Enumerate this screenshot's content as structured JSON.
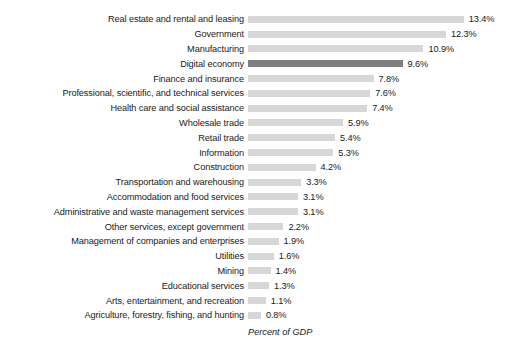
{
  "chart_data": {
    "type": "bar",
    "orientation": "horizontal",
    "title": "",
    "subtitle": "",
    "xlabel": "Percent of GDP",
    "ylabel": "",
    "xlim": [
      0,
      13.4
    ],
    "grid": false,
    "legend": null,
    "value_suffix": "%",
    "highlight_category": "Digital economy",
    "colors": {
      "bar": "#d7d7d7",
      "highlight_bar": "#7f7f7f",
      "text": "#1a1a1a",
      "background": "#ffffff"
    },
    "categories": [
      "Real estate and rental and leasing",
      "Government",
      "Manufacturing",
      "Digital economy",
      "Finance and insurance",
      "Professional, scientific, and technical services",
      "Health care and social assistance",
      "Wholesale trade",
      "Retail trade",
      "Information",
      "Construction",
      "Transportation and warehousing",
      "Accommodation and food services",
      "Administrative and waste management services",
      "Other services, except government",
      "Management of companies and enterprises",
      "Utilities",
      "Mining",
      "Educational services",
      "Arts, entertainment, and recreation",
      "Agriculture, forestry, fishing, and hunting"
    ],
    "values": [
      13.4,
      12.3,
      10.9,
      9.6,
      7.8,
      7.6,
      7.4,
      5.9,
      5.4,
      5.3,
      4.2,
      3.3,
      3.1,
      3.1,
      2.2,
      1.9,
      1.6,
      1.4,
      1.3,
      1.1,
      0.8
    ],
    "value_labels": [
      "13.4%",
      "12.3%",
      "10.9%",
      "9.6%",
      "7.8%",
      "7.6%",
      "7.4%",
      "5.9%",
      "5.4%",
      "5.3%",
      "4.2%",
      "3.3%",
      "3.1%",
      "3.1%",
      "2.2%",
      "1.9%",
      "1.6%",
      "1.4%",
      "1.3%",
      "1.1%",
      "0.8%"
    ]
  }
}
